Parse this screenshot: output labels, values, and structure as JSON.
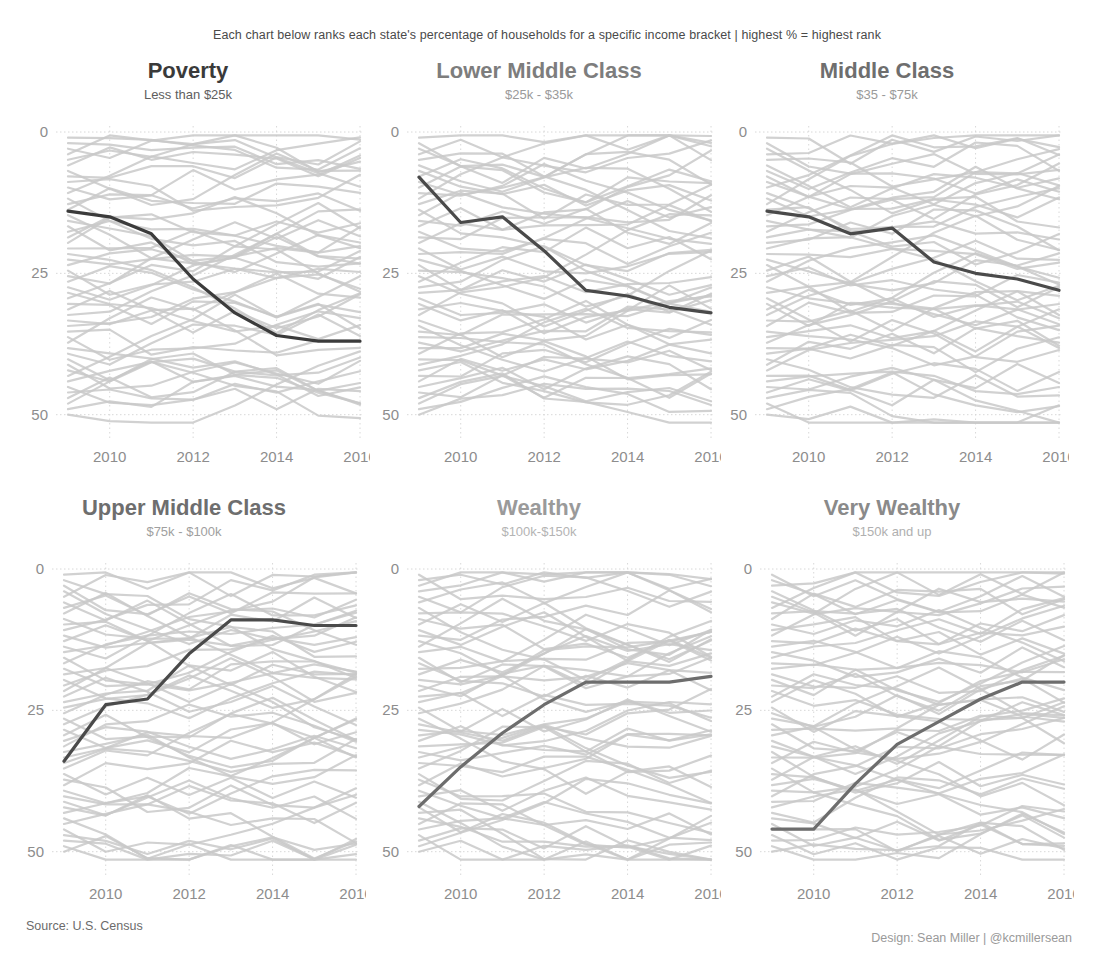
{
  "header": {
    "subtitle": "Each chart below ranks each state's percentage of households for a specific income bracket | highest % = highest rank"
  },
  "footer": {
    "source": "Source: U.S. Census",
    "design": "Design: Sean Miller | @kcmillersean"
  },
  "colors": {
    "background_line": "#c9c9c9",
    "highlight_dark": "#3b3b3b",
    "highlight_mid": "#6d6d6d",
    "title_dark": "#3a3a3a",
    "title_mid": "#8a8a8a",
    "title_light": "#a8a8a8",
    "axis_text": "#8d8d8d",
    "gridline": "#d8d8d8"
  },
  "chart_data": [
    {
      "type": "line",
      "title": "Poverty",
      "subtitle": "Less than $25k",
      "title_color": "#3a3a3a",
      "subtitle_color": "#5e5e5e",
      "highlight_color": "#3b3b3b",
      "xlabel": "",
      "ylabel": "",
      "xlim": [
        2009,
        2016
      ],
      "ylim": [
        0,
        52
      ],
      "y_inverted": true,
      "yticks": [
        0,
        25,
        50
      ],
      "ytick_labels": [
        "0",
        "25",
        "50"
      ],
      "xticks": [
        2010,
        2012,
        2014,
        2016
      ],
      "xtick_labels": [
        "2010",
        "2012",
        "2014",
        "2016"
      ],
      "grid": true,
      "legend": "none",
      "x": [
        2009,
        2010,
        2011,
        2012,
        2013,
        2014,
        2015,
        2016
      ],
      "highlight_series": {
        "name": "highlighted state",
        "values": [
          14,
          15,
          18,
          26,
          32,
          36,
          37,
          37
        ]
      },
      "background_series_count": 51,
      "background_seed": 11
    },
    {
      "type": "line",
      "title": "Lower Middle Class",
      "subtitle": "$25k - $35k",
      "title_color": "#7d7d7d",
      "subtitle_color": "#9a9a9a",
      "highlight_color": "#4a4a4a",
      "xlabel": "",
      "ylabel": "",
      "xlim": [
        2009,
        2016
      ],
      "ylim": [
        0,
        52
      ],
      "y_inverted": true,
      "yticks": [
        0,
        25,
        50
      ],
      "ytick_labels": [
        "0",
        "25",
        "50"
      ],
      "xticks": [
        2010,
        2012,
        2014,
        2016
      ],
      "xtick_labels": [
        "2010",
        "2012",
        "2014",
        "2016"
      ],
      "grid": true,
      "legend": "none",
      "x": [
        2009,
        2010,
        2011,
        2012,
        2013,
        2014,
        2015,
        2016
      ],
      "highlight_series": {
        "name": "highlighted state",
        "values": [
          8,
          16,
          15,
          21,
          28,
          29,
          31,
          32
        ]
      },
      "background_series_count": 51,
      "background_seed": 23
    },
    {
      "type": "line",
      "title": "Middle Class",
      "subtitle": "$35 - $75k",
      "title_color": "#6e6e6e",
      "subtitle_color": "#9a9a9a",
      "highlight_color": "#4a4a4a",
      "xlabel": "",
      "ylabel": "",
      "xlim": [
        2009,
        2016
      ],
      "ylim": [
        0,
        52
      ],
      "y_inverted": true,
      "yticks": [
        0,
        25,
        50
      ],
      "ytick_labels": [
        "0",
        "25",
        "50"
      ],
      "xticks": [
        2010,
        2012,
        2014,
        2016
      ],
      "xtick_labels": [
        "2010",
        "2012",
        "2014",
        "2016"
      ],
      "grid": true,
      "legend": "none",
      "x": [
        2009,
        2010,
        2011,
        2012,
        2013,
        2014,
        2015,
        2016
      ],
      "highlight_series": {
        "name": "highlighted state",
        "values": [
          14,
          15,
          18,
          17,
          23,
          25,
          26,
          28
        ]
      },
      "background_series_count": 51,
      "background_seed": 37
    },
    {
      "type": "line",
      "title": "Upper Middle Class",
      "subtitle": "$75k - $100k",
      "title_color": "#6e6e6e",
      "subtitle_color": "#a0a0a0",
      "highlight_color": "#4a4a4a",
      "xlabel": "",
      "ylabel": "",
      "xlim": [
        2009,
        2016
      ],
      "ylim": [
        0,
        52
      ],
      "y_inverted": true,
      "yticks": [
        0,
        25,
        50
      ],
      "ytick_labels": [
        "0",
        "25",
        "50"
      ],
      "xticks": [
        2010,
        2012,
        2014,
        2016
      ],
      "xtick_labels": [
        "2010",
        "2012",
        "2014",
        "2016"
      ],
      "grid": true,
      "legend": "none",
      "x": [
        2009,
        2010,
        2011,
        2012,
        2013,
        2014,
        2015,
        2016
      ],
      "highlight_series": {
        "name": "highlighted state",
        "values": [
          34,
          24,
          23,
          15,
          9,
          9,
          10,
          10
        ]
      },
      "background_series_count": 51,
      "background_seed": 53
    },
    {
      "type": "line",
      "title": "Wealthy",
      "subtitle": "$100k-$150k",
      "title_color": "#9a9a9a",
      "subtitle_color": "#b4b4b4",
      "highlight_color": "#6d6d6d",
      "xlabel": "",
      "ylabel": "",
      "xlim": [
        2009,
        2016
      ],
      "ylim": [
        0,
        52
      ],
      "y_inverted": true,
      "yticks": [
        0,
        25,
        50
      ],
      "ytick_labels": [
        "0",
        "25",
        "50"
      ],
      "xticks": [
        2010,
        2012,
        2014,
        2016
      ],
      "xtick_labels": [
        "2010",
        "2012",
        "2014",
        "2016"
      ],
      "grid": true,
      "legend": "none",
      "x": [
        2009,
        2010,
        2011,
        2012,
        2013,
        2014,
        2015,
        2016
      ],
      "highlight_series": {
        "name": "highlighted state",
        "values": [
          42,
          35,
          29,
          24,
          20,
          20,
          20,
          19
        ]
      },
      "background_series_count": 51,
      "background_seed": 67
    },
    {
      "type": "line",
      "title": "Very Wealthy",
      "subtitle": "$150k and up",
      "title_color": "#8a8a8a",
      "subtitle_color": "#b0b0b0",
      "highlight_color": "#6d6d6d",
      "xlabel": "",
      "ylabel": "",
      "xlim": [
        2009,
        2016
      ],
      "ylim": [
        0,
        52
      ],
      "y_inverted": true,
      "yticks": [
        0,
        25,
        50
      ],
      "ytick_labels": [
        "0",
        "25",
        "50"
      ],
      "xticks": [
        2010,
        2012,
        2014,
        2016
      ],
      "xtick_labels": [
        "2010",
        "2012",
        "2014",
        "2016"
      ],
      "grid": true,
      "legend": "none",
      "x": [
        2009,
        2010,
        2011,
        2012,
        2013,
        2014,
        2015,
        2016
      ],
      "highlight_series": {
        "name": "highlighted state",
        "values": [
          46,
          46,
          38,
          31,
          27,
          23,
          20,
          20
        ]
      },
      "background_series_count": 51,
      "background_seed": 89
    }
  ]
}
